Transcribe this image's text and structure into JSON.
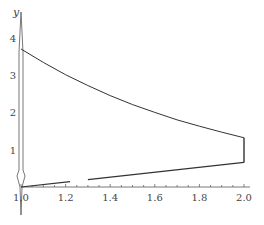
{
  "chart_data": {
    "type": "line",
    "title": "",
    "xlabel": "",
    "ylabel": "y",
    "xlim": [
      1.0,
      2.0
    ],
    "ylim": [
      0,
      4.5
    ],
    "x_ticks": [
      "1.0",
      "1.2",
      "1.4",
      "1.6",
      "1.8",
      "2.0"
    ],
    "y_ticks": [
      "1",
      "2",
      "3",
      "4"
    ],
    "grid": false,
    "legend": null,
    "series": [
      {
        "name": "upper boundary",
        "x": [
          1.0,
          1.1,
          1.2,
          1.3,
          1.4,
          1.5,
          1.6,
          1.7,
          1.8,
          1.9,
          2.0
        ],
        "values": [
          3.7,
          3.34,
          3.01,
          2.72,
          2.45,
          2.21,
          2.0,
          1.8,
          1.63,
          1.47,
          1.32
        ]
      },
      {
        "name": "lower boundary",
        "x": [
          1.0,
          1.2,
          1.4,
          1.6,
          1.8,
          2.0
        ],
        "values": [
          0.0,
          0.15,
          0.3,
          0.42,
          0.54,
          0.66
        ]
      },
      {
        "name": "right edge",
        "x": [
          2.0,
          2.0
        ],
        "values": [
          0.66,
          1.32
        ]
      }
    ],
    "line_color": "#333333",
    "region": "closed region bounded by upper curve, lower line, and vertical line x=2.0"
  }
}
